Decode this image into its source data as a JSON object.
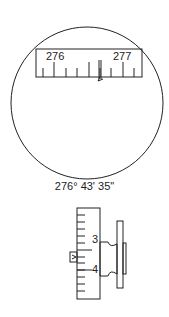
{
  "figure_top": {
    "description": "circular viewing field with degree scale",
    "scale_labels": [
      "276",
      "277"
    ],
    "reading": "276° 43' 35\""
  },
  "figure_bottom": {
    "description": "micrometer drum with scale and index",
    "scale_labels": [
      "3",
      "4"
    ]
  },
  "colors": {
    "ink": "#222222",
    "background": "#ffffff"
  }
}
